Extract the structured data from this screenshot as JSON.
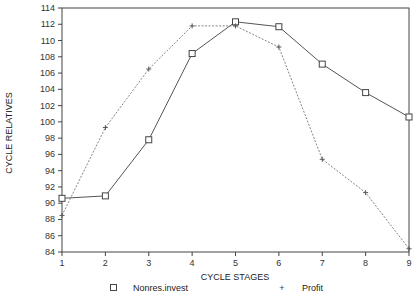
{
  "chart_data": {
    "type": "line",
    "title": "",
    "xlabel": "CYCLE STAGES",
    "ylabel": "CYCLE RELATIVES",
    "x": [
      1,
      2,
      3,
      4,
      5,
      6,
      7,
      8,
      9
    ],
    "xticks": [
      "1",
      "2",
      "3",
      "4",
      "5",
      "6",
      "7",
      "8",
      "9"
    ],
    "yticks": [
      "84",
      "86",
      "88",
      "90",
      "92",
      "94",
      "96",
      "98",
      "100",
      "102",
      "104",
      "106",
      "108",
      "110",
      "112",
      "114"
    ],
    "ylim": [
      84,
      114
    ],
    "xlim": [
      1,
      9
    ],
    "grid": false,
    "legend_position": "bottom",
    "series": [
      {
        "name": "Nonres.invest",
        "marker": "square",
        "line_style": "solid",
        "color": "#555555",
        "values": [
          90.6,
          90.9,
          97.8,
          108.4,
          112.3,
          111.7,
          107.1,
          103.6,
          100.6
        ]
      },
      {
        "name": "Profit",
        "marker": "plus",
        "line_style": "dotted",
        "color": "#777777",
        "values": [
          88.5,
          99.3,
          106.5,
          111.8,
          111.8,
          109.2,
          95.4,
          91.3,
          84.4
        ]
      }
    ]
  },
  "legend": {
    "items": [
      {
        "label": "Nonres.invest",
        "marker": "□"
      },
      {
        "label": "Profit",
        "marker": "+"
      }
    ]
  }
}
